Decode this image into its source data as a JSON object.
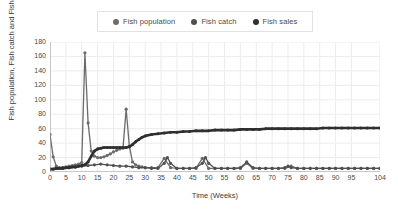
{
  "chart_data": {
    "type": "line",
    "title": "",
    "xlabel": "Time (Weeks)",
    "ylabel": "Fish population, Fish catch and Fish sale",
    "xlim": [
      0,
      104
    ],
    "ylim": [
      0,
      180
    ],
    "grid": true,
    "legend_position": "top-center",
    "xticks": [
      0,
      5,
      10,
      15,
      20,
      25,
      30,
      35,
      40,
      45,
      50,
      55,
      60,
      65,
      70,
      75,
      80,
      85,
      90,
      95,
      104
    ],
    "yticks": [
      0,
      20,
      40,
      60,
      80,
      100,
      120,
      140,
      160,
      180
    ],
    "series": [
      {
        "name": "Fish population",
        "color": "#6b6b6b",
        "x": [
          0,
          1,
          2,
          3,
          4,
          5,
          6,
          7,
          8,
          9,
          10,
          11,
          12,
          13,
          14,
          15,
          16,
          17,
          18,
          19,
          20,
          21,
          22,
          23,
          24,
          25,
          26,
          27,
          28,
          29,
          30,
          32,
          34,
          36,
          38,
          40,
          42,
          44,
          46,
          48,
          50,
          52,
          54,
          56,
          58,
          60,
          62,
          64,
          66,
          68,
          70,
          72,
          74,
          76,
          78,
          80,
          82,
          84,
          86,
          88,
          90,
          92,
          94,
          96,
          98,
          100,
          102,
          104
        ],
        "values": [
          52,
          21,
          8,
          6,
          6,
          7,
          8,
          9,
          10,
          11,
          13,
          165,
          68,
          29,
          22,
          20,
          20,
          21,
          23,
          25,
          28,
          30,
          32,
          33,
          87,
          36,
          14,
          10,
          8,
          7,
          6,
          6,
          6,
          19,
          6,
          5,
          5,
          5,
          5,
          19,
          5,
          5,
          5,
          5,
          5,
          5,
          12,
          5,
          5,
          5,
          5,
          5,
          5,
          8,
          5,
          5,
          5,
          5,
          5,
          5,
          5,
          5,
          5,
          5,
          5,
          5,
          5,
          5
        ]
      },
      {
        "name": "Fish catch",
        "color": "#4f4f4f",
        "x": [
          0,
          2,
          4,
          6,
          8,
          10,
          12,
          14,
          16,
          18,
          20,
          22,
          24,
          26,
          28,
          30,
          32,
          34,
          36,
          37,
          38,
          40,
          42,
          44,
          46,
          48,
          49,
          50,
          52,
          54,
          56,
          58,
          60,
          62,
          64,
          66,
          68,
          70,
          72,
          74,
          75,
          76,
          78,
          80,
          82,
          84,
          86,
          88,
          90,
          92,
          94,
          96,
          98,
          100,
          102,
          104
        ],
        "values": [
          4,
          5,
          6,
          6,
          7,
          8,
          9,
          10,
          11,
          10,
          9,
          8,
          8,
          7,
          6,
          6,
          5,
          5,
          12,
          20,
          12,
          5,
          5,
          5,
          6,
          12,
          20,
          12,
          5,
          5,
          5,
          5,
          6,
          14,
          6,
          5,
          5,
          5,
          5,
          6,
          8,
          6,
          5,
          5,
          5,
          5,
          5,
          5,
          5,
          5,
          5,
          5,
          5,
          5,
          5,
          5
        ]
      },
      {
        "name": "Fish sales",
        "color": "#2f2f2f",
        "x": [
          0,
          1,
          2,
          3,
          4,
          5,
          6,
          7,
          8,
          9,
          10,
          11,
          12,
          13,
          14,
          15,
          16,
          17,
          18,
          19,
          20,
          21,
          22,
          23,
          24,
          25,
          26,
          27,
          28,
          29,
          30,
          32,
          34,
          36,
          38,
          40,
          42,
          44,
          46,
          48,
          50,
          52,
          54,
          56,
          58,
          60,
          62,
          64,
          66,
          68,
          70,
          72,
          74,
          76,
          78,
          80,
          82,
          84,
          86,
          88,
          90,
          92,
          94,
          96,
          98,
          100,
          102,
          104
        ],
        "values": [
          4,
          4,
          5,
          5,
          5,
          6,
          6,
          7,
          7,
          8,
          9,
          10,
          14,
          22,
          29,
          32,
          33,
          34,
          34,
          34,
          34,
          34,
          34,
          34,
          34,
          35,
          38,
          42,
          45,
          48,
          50,
          52,
          53,
          54,
          55,
          55,
          56,
          56,
          57,
          57,
          57,
          58,
          58,
          58,
          58,
          59,
          59,
          59,
          59,
          60,
          60,
          60,
          60,
          60,
          60,
          60,
          60,
          60,
          61,
          61,
          61,
          61,
          61,
          61,
          61,
          61,
          61,
          61
        ]
      }
    ]
  },
  "legend": {
    "items": [
      {
        "label": "Fish population"
      },
      {
        "label": "Fish catch"
      },
      {
        "label": "Fish sales"
      }
    ]
  },
  "axes": {
    "x_title": "Time (Weeks)",
    "y_title": "Fish population, Fish catch and Fish sale"
  },
  "colors": {
    "grid": "#ececec",
    "axis": "#999999",
    "background": "#ffffff",
    "text": "#4a4a4a"
  }
}
